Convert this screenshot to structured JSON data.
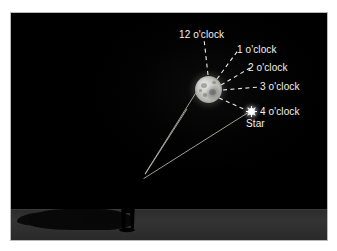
{
  "figure": {
    "scene_description": "Night sky illustration: a person on the ground points toward the moon; dashed rays radiate from the moon marked with clock positions, and a star sits at the 4 o'clock position.",
    "background_color": "#000000",
    "page_color": "#ffffff",
    "ground_color": "#303030",
    "label_color": "#f2f2ee",
    "moon_color": "#c2c2bd",
    "star_color": "#ffffff",
    "sightline_color": "#e6e6e0"
  },
  "labels": {
    "twelve": "12 o'clock",
    "one": "1 o'clock",
    "two": "2 o'clock",
    "three": "3 o'clock",
    "four": "4 o'clock",
    "star": "Star"
  },
  "objects": {
    "moon": {
      "name": "moon",
      "center_x": 197,
      "center_y": 76,
      "radius": 13
    },
    "star": {
      "name": "star",
      "center_x": 240,
      "center_y": 98
    },
    "person": {
      "name": "observer-silhouette",
      "base_x": 128,
      "base_y": 217
    }
  },
  "rays": [
    {
      "clock": "12",
      "angle_deg": 90,
      "label": "12 o'clock"
    },
    {
      "clock": "1",
      "angle_deg": 58,
      "label": "1 o'clock"
    },
    {
      "clock": "2",
      "angle_deg": 30,
      "label": "2 o'clock"
    },
    {
      "clock": "3",
      "angle_deg": 0,
      "label": "3 o'clock"
    },
    {
      "clock": "4",
      "angle_deg": -30,
      "label": "4 o'clock"
    }
  ]
}
